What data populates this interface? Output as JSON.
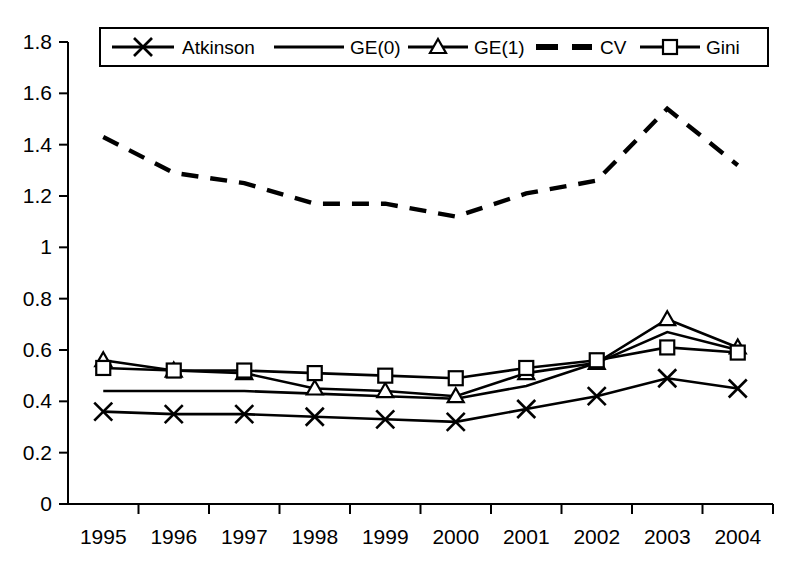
{
  "chart_data": {
    "type": "line",
    "title": "",
    "xlabel": "",
    "ylabel": "",
    "categories": [
      "1995",
      "1996",
      "1997",
      "1998",
      "1999",
      "2000",
      "2001",
      "2002",
      "2003",
      "2004"
    ],
    "x": [
      1995,
      1996,
      1997,
      1998,
      1999,
      2000,
      2001,
      2002,
      2003,
      2004
    ],
    "ylim": [
      0,
      1.8
    ],
    "yticks": [
      "0",
      "0.2",
      "0.4",
      "0.6",
      "0.8",
      "1",
      "1.2",
      "1.4",
      "1.6",
      "1.8"
    ],
    "ytick_values": [
      0,
      0.2,
      0.4,
      0.6,
      0.8,
      1.0,
      1.2,
      1.4,
      1.6,
      1.8
    ],
    "grid": false,
    "legend_position": "top",
    "series": [
      {
        "name": "Atkinson",
        "marker": "x",
        "dash": false,
        "values": [
          0.36,
          0.35,
          0.35,
          0.34,
          0.33,
          0.32,
          0.37,
          0.42,
          0.49,
          0.45
        ]
      },
      {
        "name": "GE(0)",
        "marker": "none",
        "dash": false,
        "values": [
          0.44,
          0.44,
          0.44,
          0.43,
          0.42,
          0.41,
          0.46,
          0.55,
          0.67,
          0.6
        ]
      },
      {
        "name": "GE(1)",
        "marker": "triangle",
        "dash": false,
        "values": [
          0.56,
          0.52,
          0.51,
          0.45,
          0.44,
          0.42,
          0.51,
          0.55,
          0.72,
          0.61
        ]
      },
      {
        "name": "CV",
        "marker": "none",
        "dash": true,
        "values": [
          1.43,
          1.29,
          1.25,
          1.17,
          1.17,
          1.12,
          1.21,
          1.26,
          1.54,
          1.32
        ]
      },
      {
        "name": "Gini",
        "marker": "square",
        "dash": false,
        "values": [
          0.53,
          0.52,
          0.52,
          0.51,
          0.5,
          0.49,
          0.53,
          0.56,
          0.61,
          0.59
        ]
      }
    ]
  },
  "legend": {
    "items": [
      {
        "label": "Atkinson",
        "marker": "x-marker",
        "dash": false
      },
      {
        "label": "GE(0)",
        "marker": "none",
        "dash": false
      },
      {
        "label": "GE(1)",
        "marker": "triangle-marker",
        "dash": false
      },
      {
        "label": "CV",
        "marker": "none",
        "dash": true
      },
      {
        "label": "Gini",
        "marker": "square-marker",
        "dash": false
      }
    ]
  },
  "colors": {
    "line": "#000000",
    "background": "#ffffff",
    "axis": "#000000"
  }
}
